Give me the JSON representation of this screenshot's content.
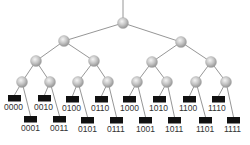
{
  "diagram": {
    "type": "binary-tree",
    "colors": {
      "edge": "#8a8a8a",
      "node_fill": "#c8c8c8",
      "node_highlight": "#f2f2f2",
      "node_shade": "#9a9a9a",
      "leaf_fill": "#111111",
      "label": "#333333"
    },
    "root_stem": {
      "x1": 123,
      "y1": 0,
      "x2": 123,
      "y2": 18
    },
    "nodes": [
      {
        "id": "r",
        "x": 123,
        "y": 23
      },
      {
        "id": "0",
        "x": 64,
        "y": 41
      },
      {
        "id": "1",
        "x": 181,
        "y": 42
      },
      {
        "id": "00",
        "x": 36,
        "y": 61
      },
      {
        "id": "01",
        "x": 94,
        "y": 61
      },
      {
        "id": "10",
        "x": 152,
        "y": 62
      },
      {
        "id": "11",
        "x": 211,
        "y": 62
      },
      {
        "id": "000",
        "x": 22,
        "y": 82
      },
      {
        "id": "001",
        "x": 50,
        "y": 82
      },
      {
        "id": "010",
        "x": 78,
        "y": 82
      },
      {
        "id": "011",
        "x": 108,
        "y": 82
      },
      {
        "id": "100",
        "x": 137,
        "y": 82
      },
      {
        "id": "101",
        "x": 167,
        "y": 82
      },
      {
        "id": "110",
        "x": 196,
        "y": 82
      },
      {
        "id": "111",
        "x": 226,
        "y": 82
      }
    ],
    "edges": [
      [
        "r",
        "0"
      ],
      [
        "r",
        "1"
      ],
      [
        "0",
        "00"
      ],
      [
        "0",
        "01"
      ],
      [
        "1",
        "10"
      ],
      [
        "1",
        "11"
      ],
      [
        "00",
        "000"
      ],
      [
        "00",
        "001"
      ],
      [
        "01",
        "010"
      ],
      [
        "01",
        "011"
      ],
      [
        "10",
        "100"
      ],
      [
        "10",
        "101"
      ],
      [
        "11",
        "110"
      ],
      [
        "11",
        "111"
      ]
    ],
    "leaves": [
      {
        "label": "0000",
        "parent": "000",
        "x": 8,
        "y": 95,
        "lx": 4,
        "ly": 110
      },
      {
        "label": "0001",
        "parent": "000",
        "x": 24,
        "y": 116,
        "lx": 21,
        "ly": 131
      },
      {
        "label": "0010",
        "parent": "001",
        "x": 38,
        "y": 95,
        "lx": 34,
        "ly": 110
      },
      {
        "label": "0011",
        "parent": "001",
        "x": 53,
        "y": 116,
        "lx": 50,
        "ly": 131
      },
      {
        "label": "0100",
        "parent": "010",
        "x": 66,
        "y": 96,
        "lx": 62,
        "ly": 111
      },
      {
        "label": "0101",
        "parent": "010",
        "x": 81,
        "y": 117,
        "lx": 78,
        "ly": 132
      },
      {
        "label": "0110",
        "parent": "011",
        "x": 95,
        "y": 96,
        "lx": 91,
        "ly": 111
      },
      {
        "label": "0111",
        "parent": "011",
        "x": 110,
        "y": 117,
        "lx": 107,
        "ly": 132
      },
      {
        "label": "1000",
        "parent": "100",
        "x": 123,
        "y": 96,
        "lx": 120,
        "ly": 111
      },
      {
        "label": "1001",
        "parent": "100",
        "x": 139,
        "y": 117,
        "lx": 136,
        "ly": 132
      },
      {
        "label": "1010",
        "parent": "101",
        "x": 153,
        "y": 96,
        "lx": 149,
        "ly": 111
      },
      {
        "label": "1011",
        "parent": "101",
        "x": 168,
        "y": 117,
        "lx": 165,
        "ly": 132
      },
      {
        "label": "1100",
        "parent": "110",
        "x": 183,
        "y": 96,
        "lx": 179,
        "ly": 111
      },
      {
        "label": "1101",
        "parent": "110",
        "x": 199,
        "y": 117,
        "lx": 196,
        "ly": 132
      },
      {
        "label": "1110",
        "parent": "111",
        "x": 212,
        "y": 96,
        "lx": 208,
        "ly": 111
      },
      {
        "label": "1111",
        "parent": "111",
        "x": 227,
        "y": 117,
        "lx": 224,
        "ly": 132
      }
    ]
  }
}
